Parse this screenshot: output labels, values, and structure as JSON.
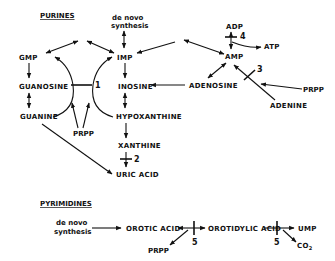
{
  "purines": {
    "title": "PURINES",
    "de_novo_1": "de novo",
    "de_novo_2": "synthesis",
    "gmp": "GMP",
    "imp": "IMP",
    "amp": "AMP",
    "adp": "ADP",
    "atp": "ATP",
    "guanosine": "GUANOSINE",
    "inosine": "INOSINE",
    "adenosine": "ADENOSINE",
    "guanine": "GUANINE",
    "hypoxanthine": "HYPOXANTHINE",
    "xanthine": "XANTHINE",
    "uric_acid": "URIC ACID",
    "adenine": "ADENINE",
    "prpp_left": "PRPP",
    "prpp_right": "PRPP",
    "enzyme_1": "1",
    "enzyme_2": "2",
    "enzyme_3": "3",
    "enzyme_4": "4"
  },
  "pyrimidines": {
    "title": "PYRIMIDINES",
    "de_novo_1": "de novo",
    "de_novo_2": "synthesis",
    "orotic_acid": "OROTIC ACID",
    "orotidylic_acid": "OROTIDYLIC ACID",
    "ump": "UMP",
    "prpp": "PRPP",
    "co2": "CO",
    "co2_sub": "2",
    "enzyme_5a": "5",
    "enzyme_5b": "5"
  }
}
